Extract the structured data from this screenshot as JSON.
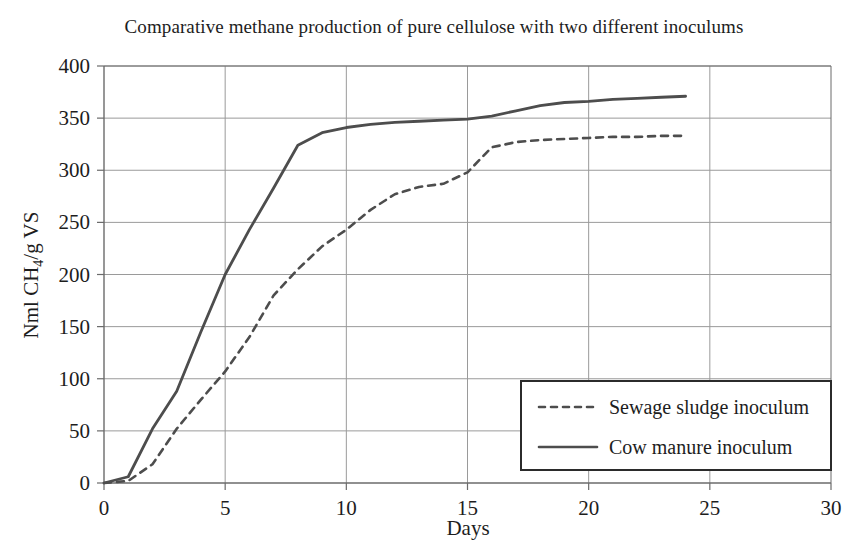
{
  "chart_data": {
    "type": "line",
    "title": "Comparative methane production of pure cellulose with two different inoculums",
    "xlabel": "Days",
    "ylabel": "Nml CH4/g VS",
    "ylabel_parts": {
      "prefix": "Nml CH",
      "sub": "4",
      "suffix": "/g VS"
    },
    "xlim": [
      0,
      30
    ],
    "ylim": [
      0,
      400
    ],
    "xticks": [
      0,
      5,
      10,
      15,
      20,
      25,
      30
    ],
    "yticks": [
      0,
      50,
      100,
      150,
      200,
      250,
      300,
      350,
      400
    ],
    "xtick_labels": [
      "0",
      "5",
      "10",
      "15",
      "20",
      "25",
      "30"
    ],
    "ytick_labels": [
      "0",
      "50",
      "100",
      "150",
      "200",
      "250",
      "300",
      "350",
      "400"
    ],
    "grid": true,
    "legend_position": "lower right",
    "line_color": "#4d4d4d",
    "grid_color": "#9a9a9a",
    "axis_color": "#6b6b6b",
    "series": [
      {
        "name": "Sewage sludge inoculum",
        "style": "dashed",
        "x": [
          0,
          1,
          2,
          3,
          4,
          5,
          6,
          7,
          8,
          9,
          10,
          11,
          12,
          13,
          14,
          15,
          16,
          17,
          18,
          19,
          20,
          21,
          22,
          23,
          24
        ],
        "values": [
          0,
          2,
          18,
          52,
          80,
          107,
          140,
          180,
          205,
          227,
          243,
          262,
          277,
          284,
          287,
          298,
          322,
          327,
          329,
          330,
          331,
          332,
          332,
          333,
          333
        ]
      },
      {
        "name": "Cow manure inoculum",
        "style": "solid",
        "x": [
          0,
          1,
          2,
          3,
          4,
          5,
          6,
          7,
          8,
          9,
          10,
          11,
          12,
          13,
          14,
          15,
          16,
          17,
          18,
          19,
          20,
          21,
          22,
          23,
          24
        ],
        "values": [
          0,
          6,
          52,
          88,
          145,
          200,
          243,
          283,
          324,
          336,
          341,
          344,
          346,
          347,
          348,
          349,
          352,
          357,
          362,
          365,
          366,
          368,
          369,
          370,
          371
        ]
      }
    ],
    "legend": [
      {
        "label": "Sewage sludge inoculum",
        "style": "dashed"
      },
      {
        "label": "Cow manure inoculum",
        "style": "solid"
      }
    ]
  }
}
